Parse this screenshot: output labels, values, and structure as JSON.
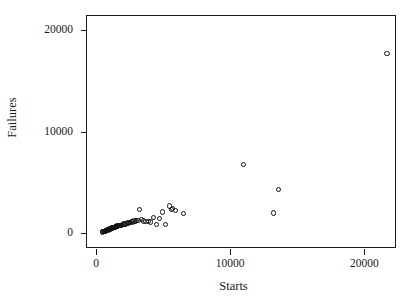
{
  "chart_data": {
    "type": "scatter",
    "title": "",
    "xlabel": "Starts",
    "ylabel": "Failures",
    "xlim": [
      -680,
      22440
    ],
    "ylim": [
      -1560,
      21380
    ],
    "xticks": [
      0,
      10000,
      20000
    ],
    "yticks": [
      0,
      10000,
      20000
    ],
    "xticklabels": [
      "0",
      "10000",
      "20000"
    ],
    "yticklabels": [
      "0",
      "10000",
      "20000"
    ],
    "grid": false,
    "legend": null,
    "marker": "open-circle",
    "marker_color": "#111111",
    "series": [
      {
        "name": "Starts vs Failures",
        "x": [
          450,
          520,
          560,
          600,
          620,
          660,
          700,
          720,
          750,
          780,
          800,
          830,
          860,
          880,
          900,
          930,
          960,
          1000,
          1030,
          1060,
          1100,
          1150,
          1180,
          1220,
          1260,
          1300,
          1340,
          1380,
          1420,
          1460,
          1500,
          1560,
          1620,
          1680,
          1740,
          1800,
          1870,
          1940,
          2010,
          2080,
          2150,
          2230,
          2320,
          2400,
          2480,
          2560,
          2650,
          2740,
          2830,
          2920,
          3020,
          3130,
          3260,
          3400,
          3560,
          3720,
          3900,
          4080,
          4270,
          4480,
          4700,
          4950,
          5200,
          5480,
          5600,
          5720,
          5900,
          6500,
          11000,
          13200,
          13600,
          21700
        ],
        "y": [
          120,
          140,
          160,
          150,
          200,
          180,
          230,
          210,
          260,
          240,
          300,
          280,
          330,
          310,
          360,
          340,
          390,
          370,
          420,
          400,
          460,
          440,
          500,
          480,
          540,
          520,
          580,
          560,
          620,
          600,
          660,
          700,
          680,
          740,
          720,
          790,
          770,
          840,
          820,
          900,
          880,
          960,
          1010,
          990,
          1070,
          1050,
          1120,
          1100,
          1190,
          1160,
          1260,
          1230,
          2340,
          1310,
          1200,
          1160,
          1130,
          1090,
          1560,
          830,
          1470,
          2080,
          840,
          2670,
          2290,
          2400,
          2260,
          1900,
          6730,
          1980,
          4300,
          17700
        ]
      }
    ]
  },
  "figure": {
    "background": "#ffffff",
    "frame_color": "#1a1a1a",
    "text_color": "#1a1a1a"
  }
}
